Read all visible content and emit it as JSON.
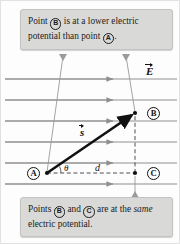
{
  "figure": {
    "background_color": "#fdfdfd",
    "callout_fill": "#d9d9d7",
    "field_line_color": "#8f8f8f",
    "vector_color": "#111111"
  },
  "callouts": {
    "top": {
      "text_part_1": "Point",
      "point_1": "B",
      "text_part_2": "is at a lower electric potential than point",
      "point_2": "A",
      "text_part_3": ".",
      "full_text": "Point B is at a lower electric potential than point A."
    },
    "bottom": {
      "text_part_1": "Points",
      "point_1": "B",
      "text_part_2": "and",
      "point_2": "C",
      "text_part_3": "are at the",
      "emphasis": "same",
      "text_part_4": "electric potential.",
      "full_text": "Points B and C are at the same electric potential."
    }
  },
  "labels": {
    "field_vector": "E",
    "displacement_vector": "s",
    "distance": "d",
    "angle": "θ",
    "point_a": "A",
    "point_b": "B",
    "point_c": "C"
  },
  "diagram": {
    "field_line_count": 6,
    "field_lines_y": [
      78,
      99,
      120,
      141,
      162,
      183
    ],
    "field_line_x_start": 4,
    "field_line_x_end": 176,
    "field_arrow_x": 110,
    "field_direction": "right",
    "point_a_position": [
      46,
      172
    ],
    "point_b_position": [
      134,
      112
    ],
    "point_c_position": [
      134,
      172
    ],
    "vector_s_from": "A",
    "vector_s_to": "B",
    "dashed_horizontal_from": "A",
    "dashed_horizontal_to": "C",
    "dashed_vertical_from": "C",
    "dashed_vertical_to": "B",
    "leader_top_left_from": [
      62,
      55
    ],
    "leader_top_left_to": [
      46,
      172
    ],
    "leader_top_right_from": [
      125,
      55
    ],
    "leader_top_right_to": [
      134,
      112
    ],
    "leader_bottom_from": [
      134,
      196
    ],
    "leader_bottom_to": [
      134,
      174
    ]
  }
}
